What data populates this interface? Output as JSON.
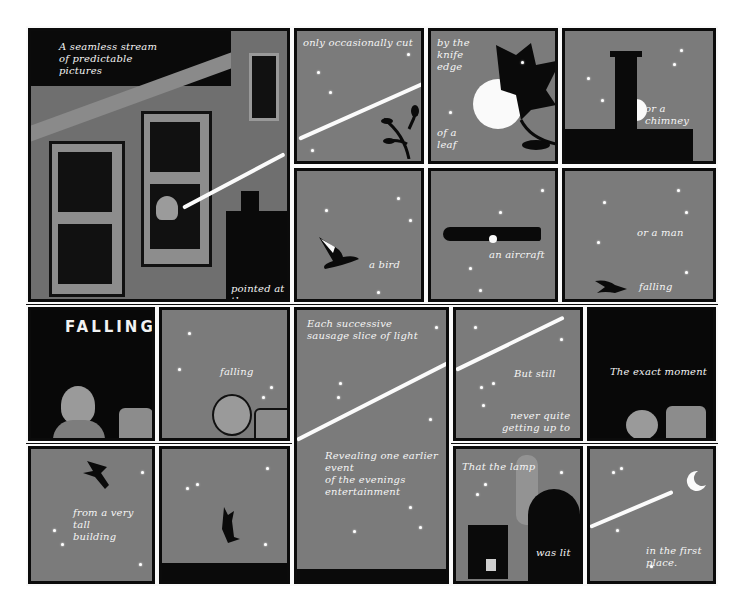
{
  "comic": {
    "panels": [
      {
        "id": "p1",
        "caption_top": "A seamless stream\nof predictable\npictures",
        "caption_bottom": "pointed at the moon"
      },
      {
        "id": "p2",
        "caption": "only occasionally cut"
      },
      {
        "id": "p3",
        "caption_top": "by the\nknife\nedge",
        "caption_bottom": "of a\nleaf"
      },
      {
        "id": "p4",
        "caption": "or a chimney"
      },
      {
        "id": "p5",
        "caption": "a bird"
      },
      {
        "id": "p6",
        "caption": "an aircraft"
      },
      {
        "id": "p7",
        "caption_top": "or a man",
        "caption_bottom": "falling"
      },
      {
        "id": "p8",
        "title": "FALLING"
      },
      {
        "id": "p9",
        "caption": "falling"
      },
      {
        "id": "p10",
        "caption_top": "Each successive\nsausage slice of light",
        "caption_bottom": "Revealing one earlier event\nof the evenings entertainment"
      },
      {
        "id": "p11",
        "caption_top": "But still",
        "caption_bottom": "never quite\ngetting up to"
      },
      {
        "id": "p12",
        "caption": "The exact moment"
      },
      {
        "id": "p13",
        "caption": "from a very tall\nbuilding"
      },
      {
        "id": "p14",
        "caption": ""
      },
      {
        "id": "p15",
        "caption_top": "That the lamp",
        "caption_bottom": "was lit"
      },
      {
        "id": "p16",
        "caption": "in the first place."
      }
    ],
    "colors": {
      "sky": "#7b7b7b",
      "ink": "#0a0a0a",
      "gutter": "#fafafa",
      "light": "#fbfbfb"
    }
  }
}
